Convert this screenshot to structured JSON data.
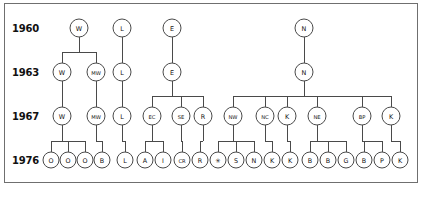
{
  "figure": {
    "kind": "pedigree-chart",
    "title": "",
    "border_color": "#6f6f6f",
    "node_stroke_color": "#4a4a4a",
    "node_fill_color": "#ffffff",
    "text_color": "#111111",
    "background_color": "#ffffff"
  },
  "generations": [
    {
      "year": "1960",
      "y": 28
    },
    {
      "year": "1963",
      "y": 72
    },
    {
      "year": "1967",
      "y": 116
    },
    {
      "year": "1976",
      "y": 160
    }
  ],
  "year_axis": {
    "labels": [
      "1960",
      "1963",
      "1967",
      "1976"
    ],
    "x": 12
  },
  "chart_data": {
    "type": "diagram",
    "title": "",
    "rows": [
      {
        "year": "1960",
        "y": 28,
        "nodes": [
          {
            "id": "g1-w",
            "label": "W",
            "x": 79,
            "r": 9
          },
          {
            "id": "g1-l",
            "label": "L",
            "x": 122,
            "r": 9
          },
          {
            "id": "g1-e",
            "label": "E",
            "x": 172,
            "r": 9
          },
          {
            "id": "g1-n",
            "label": "N",
            "x": 304,
            "r": 9
          }
        ]
      },
      {
        "year": "1963",
        "y": 72,
        "nodes": [
          {
            "id": "g2-w",
            "label": "W",
            "x": 62,
            "r": 9
          },
          {
            "id": "g2-mw",
            "label": "MW",
            "x": 96,
            "r": 9
          },
          {
            "id": "g2-l",
            "label": "L",
            "x": 122,
            "r": 9
          },
          {
            "id": "g2-e",
            "label": "E",
            "x": 172,
            "r": 9
          },
          {
            "id": "g2-n",
            "label": "N",
            "x": 304,
            "r": 9
          }
        ]
      },
      {
        "year": "1967",
        "y": 116,
        "nodes": [
          {
            "id": "g3-w",
            "label": "W",
            "x": 62,
            "r": 9
          },
          {
            "id": "g3-mw",
            "label": "MW",
            "x": 96,
            "r": 9
          },
          {
            "id": "g3-l",
            "label": "L",
            "x": 122,
            "r": 9
          },
          {
            "id": "g3-ec",
            "label": "EC",
            "x": 152,
            "r": 9
          },
          {
            "id": "g3-se",
            "label": "SE",
            "x": 181,
            "r": 9
          },
          {
            "id": "g3-r",
            "label": "R",
            "x": 203,
            "r": 9
          },
          {
            "id": "g3-nw",
            "label": "NW",
            "x": 233,
            "r": 9
          },
          {
            "id": "g3-nc",
            "label": "NC",
            "x": 265,
            "r": 9
          },
          {
            "id": "g3-k",
            "label": "K",
            "x": 287,
            "r": 9
          },
          {
            "id": "g3-ne",
            "label": "NE",
            "x": 317,
            "r": 9
          },
          {
            "id": "g3-bp",
            "label": "BP",
            "x": 362,
            "r": 9
          },
          {
            "id": "g3-k2",
            "label": "K",
            "x": 391,
            "r": 9
          }
        ]
      },
      {
        "year": "1976",
        "y": 160,
        "nodes": [
          {
            "id": "g4-o1",
            "label": "O",
            "x": 51,
            "r": 8
          },
          {
            "id": "g4-o2",
            "label": "O",
            "x": 68,
            "r": 8
          },
          {
            "id": "g4-o3",
            "label": "O",
            "x": 85,
            "r": 8
          },
          {
            "id": "g4-b1",
            "label": "B",
            "x": 102,
            "r": 8
          },
          {
            "id": "g4-l",
            "label": "L",
            "x": 125,
            "r": 8
          },
          {
            "id": "g4-a",
            "label": "A",
            "x": 145,
            "r": 8
          },
          {
            "id": "g4-i",
            "label": "I",
            "x": 163,
            "r": 8
          },
          {
            "id": "g4-cr",
            "label": "CR",
            "x": 182,
            "r": 8
          },
          {
            "id": "g4-r",
            "label": "R",
            "x": 200,
            "r": 8
          },
          {
            "id": "g4-star",
            "label": "✳",
            "x": 218,
            "r": 8
          },
          {
            "id": "g4-s",
            "label": "S",
            "x": 236,
            "r": 8
          },
          {
            "id": "g4-n",
            "label": "N",
            "x": 254,
            "r": 8
          },
          {
            "id": "g4-k1",
            "label": "K",
            "x": 272,
            "r": 8
          },
          {
            "id": "g4-k2",
            "label": "K",
            "x": 290,
            "r": 8
          },
          {
            "id": "g4-b2",
            "label": "B",
            "x": 310,
            "r": 8
          },
          {
            "id": "g4-b3",
            "label": "B",
            "x": 328,
            "r": 8
          },
          {
            "id": "g4-g",
            "label": "G",
            "x": 346,
            "r": 8
          },
          {
            "id": "g4-b4",
            "label": "B",
            "x": 364,
            "r": 8
          },
          {
            "id": "g4-p",
            "label": "P",
            "x": 382,
            "r": 8
          },
          {
            "id": "g4-k3",
            "label": "K",
            "x": 400,
            "r": 8
          }
        ]
      }
    ],
    "links": [
      {
        "from": "g1-w",
        "to": [
          "g2-w",
          "g2-mw"
        ]
      },
      {
        "from": "g1-l",
        "to": [
          "g2-l"
        ]
      },
      {
        "from": "g1-e",
        "to": [
          "g2-e"
        ]
      },
      {
        "from": "g1-n",
        "to": [
          "g2-n"
        ]
      },
      {
        "from": "g2-w",
        "to": [
          "g3-w"
        ]
      },
      {
        "from": "g2-mw",
        "to": [
          "g3-mw"
        ]
      },
      {
        "from": "g2-l",
        "to": [
          "g3-l"
        ]
      },
      {
        "from": "g2-e",
        "to": [
          "g3-ec",
          "g3-se",
          "g3-r"
        ]
      },
      {
        "from": "g2-n",
        "to": [
          "g3-nw",
          "g3-nc",
          "g3-k",
          "g3-ne",
          "g3-bp",
          "g3-k2"
        ]
      },
      {
        "from": "g3-w",
        "to": [
          "g4-o1",
          "g4-o2",
          "g4-o3"
        ]
      },
      {
        "from": "g3-mw",
        "to": [
          "g4-b1"
        ]
      },
      {
        "from": "g3-l",
        "to": [
          "g4-l"
        ]
      },
      {
        "from": "g3-ec",
        "to": [
          "g4-a",
          "g4-i"
        ]
      },
      {
        "from": "g3-se",
        "to": [
          "g4-cr"
        ]
      },
      {
        "from": "g3-r",
        "to": [
          "g4-r"
        ]
      },
      {
        "from": "g3-nw",
        "to": [
          "g4-star",
          "g4-s",
          "g4-n"
        ]
      },
      {
        "from": "g3-nc",
        "to": [
          "g4-k1"
        ]
      },
      {
        "from": "g3-k",
        "to": [
          "g4-k2"
        ]
      },
      {
        "from": "g3-ne",
        "to": [
          "g4-b2",
          "g4-b3",
          "g4-g"
        ]
      },
      {
        "from": "g3-bp",
        "to": [
          "g4-b4",
          "g4-p"
        ]
      },
      {
        "from": "g3-k2",
        "to": [
          "g4-k3"
        ]
      }
    ]
  }
}
